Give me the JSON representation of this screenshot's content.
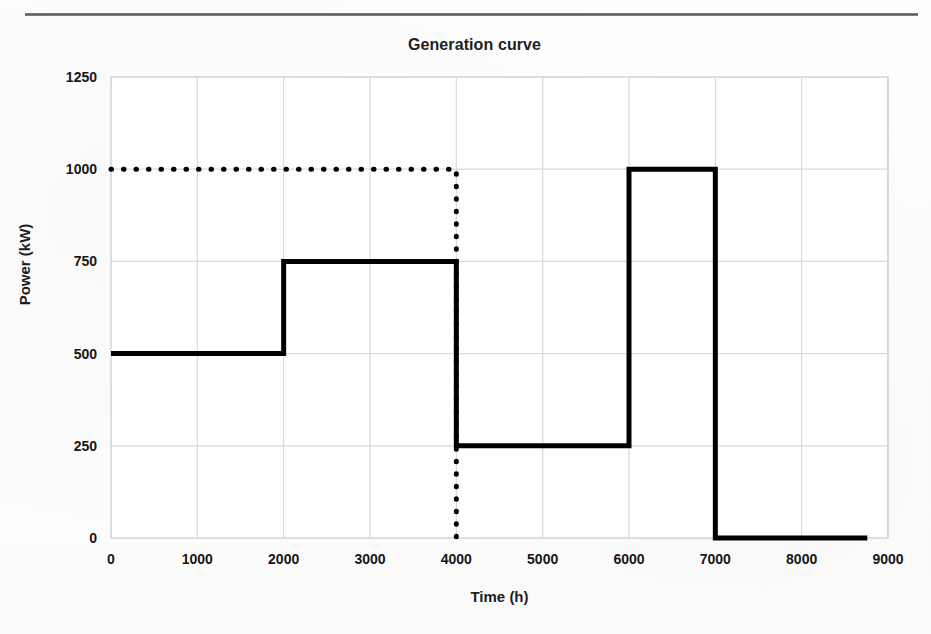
{
  "page": {
    "header_fragment": "",
    "rule_color": "#5a5a5a",
    "background": "#fdfdfd"
  },
  "chart_data": {
    "type": "line",
    "title": "Generation curve",
    "xlabel": "Time (h)",
    "ylabel": "Power (kW)",
    "xlim": [
      0,
      9000
    ],
    "ylim": [
      0,
      1250
    ],
    "xticks": [
      0,
      1000,
      2000,
      3000,
      4000,
      5000,
      6000,
      7000,
      8000,
      9000
    ],
    "yticks": [
      0,
      250,
      500,
      750,
      1000,
      1250
    ],
    "xtick_labels": [
      "0",
      "1000",
      "2000",
      "3000",
      "4000",
      "5000",
      "6000",
      "7000",
      "8000",
      "9000"
    ],
    "ytick_labels": [
      "0",
      "250",
      "500",
      "750",
      "1000",
      "1250"
    ],
    "grid": true,
    "legend": false,
    "series": [
      {
        "name": "Generation curve",
        "style": "step-solid",
        "color": "#000000",
        "linewidth": 5,
        "x": [
          0,
          2000,
          2000,
          4000,
          4000,
          6000,
          6000,
          7000,
          7000,
          8760
        ],
        "y": [
          500,
          500,
          750,
          750,
          250,
          250,
          1000,
          1000,
          0,
          0
        ],
        "steps": [
          {
            "x_start": 0,
            "x_end": 2000,
            "power": 500
          },
          {
            "x_start": 2000,
            "x_end": 4000,
            "power": 750
          },
          {
            "x_start": 4000,
            "x_end": 6000,
            "power": 250
          },
          {
            "x_start": 6000,
            "x_end": 7000,
            "power": 1000
          },
          {
            "x_start": 7000,
            "x_end": 8760,
            "power": 0
          }
        ]
      },
      {
        "name": "rated power reference",
        "style": "dotted",
        "color": "#000000",
        "linewidth": 5,
        "x": [
          0,
          4000,
          4000
        ],
        "y": [
          1000,
          1000,
          0
        ]
      }
    ],
    "annotations": []
  }
}
